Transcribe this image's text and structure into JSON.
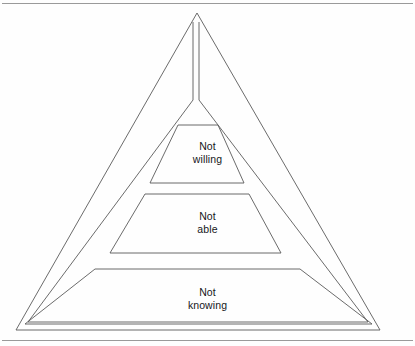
{
  "figure": {
    "type": "pyramid-diagram",
    "shape": "triangle",
    "background_color": "#fefefe",
    "stroke_color": "#555555",
    "text_color": "#16161a",
    "frame": {
      "top_rule": true,
      "bottom_rule": true
    },
    "outer_triangle": {
      "apex": [
        197,
        13
      ],
      "bottom_left": [
        16,
        330
      ],
      "bottom_right": [
        380,
        330
      ]
    },
    "inner_triangle": {
      "apex_left": [
        193,
        22
      ],
      "apex_right": [
        199,
        22
      ],
      "bottom_left": [
        28,
        322
      ],
      "bottom_right": [
        368,
        322
      ]
    },
    "bands": [
      {
        "id": "not-willing",
        "label": "Not\nwilling",
        "line1": "Not",
        "line2": "willing",
        "level": 1,
        "position": "top",
        "top_left": [
          178,
          125
        ],
        "top_right": [
          218,
          125
        ],
        "bottom_left": [
          150,
          183
        ],
        "bottom_right": [
          244,
          183
        ]
      },
      {
        "id": "not-able",
        "label": "Not\nable",
        "line1": "Not",
        "line2": "able",
        "level": 2,
        "position": "middle",
        "top_left": [
          145,
          194
        ],
        "top_right": [
          249,
          194
        ],
        "bottom_left": [
          110,
          253
        ],
        "bottom_right": [
          281,
          253
        ]
      },
      {
        "id": "not-knowing",
        "label": "Not\nknowing",
        "line1": "Not",
        "line2": "knowing",
        "level": 3,
        "position": "bottom",
        "top_left": [
          95,
          269
        ],
        "top_right": [
          300,
          269
        ],
        "bottom_left": [
          25,
          324
        ],
        "bottom_right": [
          372,
          324
        ]
      }
    ]
  }
}
